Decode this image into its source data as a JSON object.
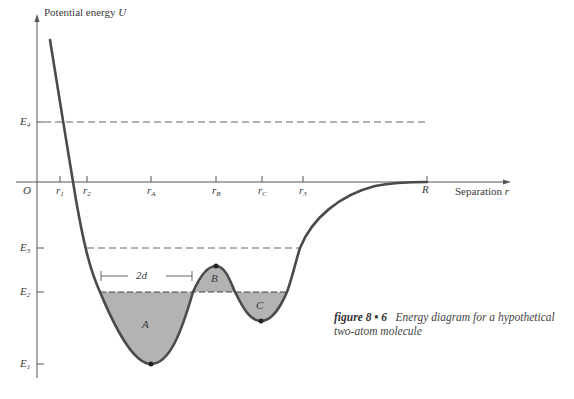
{
  "axes": {
    "y_label": "Potential energy",
    "y_symbol": "U",
    "x_label": "Separation",
    "x_symbol": "r",
    "origin": "O"
  },
  "x_ticks": [
    {
      "label": "r",
      "sub": "1"
    },
    {
      "label": "r",
      "sub": "2"
    },
    {
      "label": "r",
      "sub": "A"
    },
    {
      "label": "r",
      "sub": "B"
    },
    {
      "label": "r",
      "sub": "C"
    },
    {
      "label": "r",
      "sub": "3"
    },
    {
      "label": "R",
      "sub": ""
    }
  ],
  "energy_levels": [
    {
      "label": "E",
      "sub": "4"
    },
    {
      "label": "E",
      "sub": "3"
    },
    {
      "label": "E",
      "sub": "2"
    },
    {
      "label": "E",
      "sub": "1"
    }
  ],
  "regions": {
    "a": "A",
    "b": "B",
    "c": "C"
  },
  "width_marker": "2d",
  "caption": {
    "figure_label": "figure 8 • 6",
    "text": "Energy diagram for a hypothetical two-atom molecule"
  },
  "colors": {
    "curve": "#4a4a4a",
    "fill": "#b3b3b3",
    "axis": "#555555"
  }
}
